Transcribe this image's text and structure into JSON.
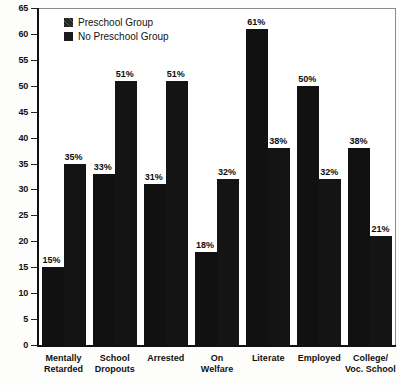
{
  "chart_data": {
    "type": "bar",
    "title": "",
    "xlabel": "",
    "ylabel": "",
    "ylim": [
      0,
      65
    ],
    "ytick_step": 5,
    "yticks": [
      0,
      5,
      10,
      15,
      20,
      25,
      30,
      35,
      40,
      45,
      50,
      55,
      60,
      65
    ],
    "grid": false,
    "legend_position": "top-left",
    "value_label_suffix": "%",
    "categories": [
      "Mentally Retarded",
      "School Dropouts",
      "Arrested",
      "On Welfare",
      "Literate",
      "Employed",
      "College/ Voc. School"
    ],
    "category_lines": [
      [
        "Mentally",
        "Retarded"
      ],
      [
        "School",
        "Dropouts"
      ],
      [
        "Arrested",
        ""
      ],
      [
        "On",
        "Welfare"
      ],
      [
        "Literate",
        ""
      ],
      [
        "Employed",
        ""
      ],
      [
        "College/",
        "Voc. School"
      ]
    ],
    "series": [
      {
        "name": "Preschool Group",
        "color": "#111111",
        "values": [
          15,
          33,
          31,
          18,
          61,
          50,
          38
        ],
        "labels": [
          "15%",
          "33%",
          "31%",
          "18%",
          "61%",
          "50%",
          "38%"
        ]
      },
      {
        "name": "No Preschool Group",
        "color": "#141414",
        "values": [
          35,
          51,
          51,
          32,
          38,
          32,
          21
        ],
        "labels": [
          "35%",
          "51%",
          "51%",
          "32%",
          "38%",
          "32%",
          "21%"
        ]
      }
    ]
  },
  "legend": {
    "items": [
      {
        "label": "Preschool Group",
        "swatch": "hatched-dark-square"
      },
      {
        "label": "No Preschool Group",
        "swatch": "solid-dark-square"
      }
    ]
  },
  "axis": {
    "y_tick_labels": [
      "65",
      "60",
      "55",
      "50",
      "45",
      "40",
      "35",
      "30",
      "25",
      "20",
      "15",
      "10",
      "5",
      "0"
    ]
  }
}
